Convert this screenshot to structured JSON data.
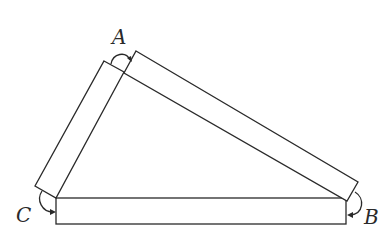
{
  "diagram": {
    "type": "triangle of three hinged bars",
    "vertices": [
      {
        "id": "A",
        "label": "A",
        "position": "top"
      },
      {
        "id": "B",
        "label": "B",
        "position": "bottom-right"
      },
      {
        "id": "C",
        "label": "C",
        "position": "bottom-left"
      }
    ],
    "bars": [
      {
        "id": "bar-CA",
        "from": "C",
        "to": "A"
      },
      {
        "id": "bar-AB",
        "from": "A",
        "to": "B"
      },
      {
        "id": "bar-CB",
        "from": "C",
        "to": "B"
      }
    ],
    "angle_arrows": [
      "A",
      "B",
      "C"
    ],
    "colors": {
      "stroke": "#2a2a2a",
      "background": "#ffffff"
    }
  }
}
